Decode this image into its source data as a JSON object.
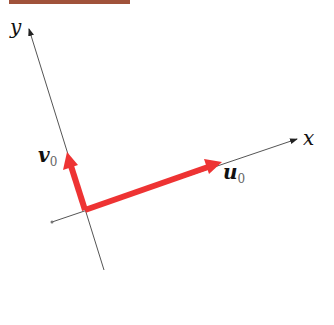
{
  "diagram": {
    "axes": {
      "x": {
        "label": "x"
      },
      "y": {
        "label": "y"
      }
    },
    "vectors": [
      {
        "name": "u",
        "subscript": "0",
        "color": "#ee3333"
      },
      {
        "name": "v",
        "subscript": "0",
        "color": "#ee3333"
      }
    ],
    "header_bar_color": "#a0523a",
    "axis_color": "#555555"
  }
}
